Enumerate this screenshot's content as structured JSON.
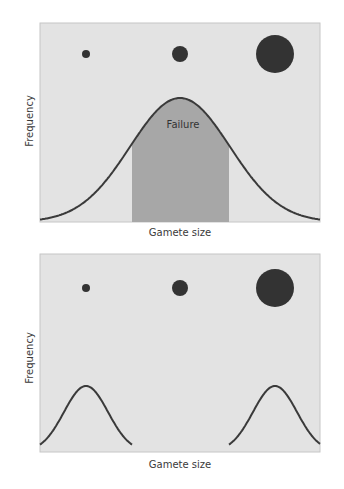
{
  "colors": {
    "panel_bg": "#e3e3e3",
    "panel_border": "#c6c6c6",
    "curve": "#3a3a3a",
    "failure_fill": "#a7a7a7",
    "gamete": "#333333"
  },
  "panels": [
    {
      "id": "top",
      "xlabel": "Gamete size",
      "ylabel": "Frequency",
      "region_label": "Failure",
      "gametes": [
        {
          "size": "small",
          "r": 4
        },
        {
          "size": "medium",
          "r": 8
        },
        {
          "size": "large",
          "r": 19
        }
      ],
      "distribution": "unimodal",
      "shaded_region": "middle (intermediate gamete sizes)"
    },
    {
      "id": "bottom",
      "xlabel": "Gamete size",
      "ylabel": "Frequency",
      "gametes": [
        {
          "size": "small",
          "r": 4
        },
        {
          "size": "medium",
          "r": 8
        },
        {
          "size": "large",
          "r": 19
        }
      ],
      "distribution": "bimodal",
      "peaks": [
        "small",
        "large"
      ]
    }
  ],
  "chart_data": [
    {
      "type": "area",
      "title": "",
      "xlabel": "Gamete size",
      "ylabel": "Frequency",
      "series": [
        {
          "name": "gamete size distribution",
          "shape": "normal",
          "center": 0.5,
          "relative_height": 0.62
        },
        {
          "name": "Failure (shaded)",
          "x_range": [
            0.33,
            0.68
          ]
        }
      ],
      "annotations": [
        "Failure"
      ],
      "grid": false
    },
    {
      "type": "line",
      "title": "",
      "xlabel": "Gamete size",
      "ylabel": "Frequency",
      "series": [
        {
          "name": "small-gamete peak",
          "shape": "normal",
          "center": 0.16,
          "relative_height": 0.34
        },
        {
          "name": "large-gamete peak",
          "shape": "normal",
          "center": 0.84,
          "relative_height": 0.34
        }
      ],
      "grid": false
    }
  ]
}
